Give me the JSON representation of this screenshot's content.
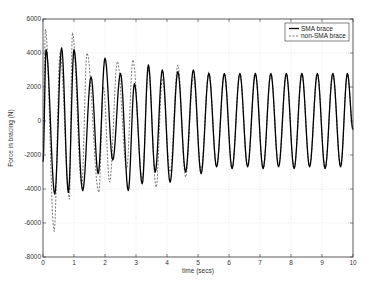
{
  "chart_data": {
    "type": "line",
    "title": "",
    "xlabel": "time (secs)",
    "ylabel": "Force in bracing (N)",
    "xlim": [
      0,
      10
    ],
    "ylim": [
      -8000,
      6000
    ],
    "xticks": [
      0,
      1,
      2,
      3,
      4,
      5,
      6,
      7,
      8,
      9,
      10
    ],
    "yticks": [
      -8000,
      -6000,
      -4000,
      -2000,
      0,
      2000,
      4000,
      6000
    ],
    "grid": true,
    "legend_position": "upper right",
    "series": [
      {
        "name": "SMA brace",
        "style": "solid",
        "color": "#000000",
        "extrema": [
          [
            0.0,
            -2400
          ],
          [
            0.1,
            4200
          ],
          [
            0.38,
            -4300
          ],
          [
            0.6,
            4300
          ],
          [
            0.82,
            -4200
          ],
          [
            1.0,
            4200
          ],
          [
            1.28,
            -4100
          ],
          [
            1.55,
            2600
          ],
          [
            1.78,
            -3100
          ],
          [
            2.0,
            3700
          ],
          [
            2.25,
            -2300
          ],
          [
            2.5,
            2800
          ],
          [
            2.75,
            -4100
          ],
          [
            2.95,
            2200
          ],
          [
            3.2,
            -3700
          ],
          [
            3.4,
            3300
          ],
          [
            3.62,
            -3000
          ],
          [
            3.85,
            3000
          ],
          [
            4.1,
            -3600
          ],
          [
            4.35,
            2900
          ],
          [
            4.6,
            -3000
          ],
          [
            4.85,
            3000
          ],
          [
            5.1,
            -3100
          ],
          [
            5.35,
            2800
          ],
          [
            5.6,
            -2700
          ],
          [
            5.85,
            2800
          ],
          [
            6.1,
            -2800
          ],
          [
            6.35,
            2800
          ],
          [
            6.6,
            -2700
          ],
          [
            6.85,
            2800
          ],
          [
            7.1,
            -2800
          ],
          [
            7.35,
            2800
          ],
          [
            7.6,
            -2700
          ],
          [
            7.85,
            2800
          ],
          [
            8.1,
            -2800
          ],
          [
            8.35,
            2800
          ],
          [
            8.6,
            -2700
          ],
          [
            8.85,
            2800
          ],
          [
            9.1,
            -2800
          ],
          [
            9.35,
            2800
          ],
          [
            9.6,
            -2700
          ],
          [
            9.82,
            2800
          ],
          [
            10.0,
            -500
          ]
        ]
      },
      {
        "name": "non-SMA brace",
        "style": "dashed",
        "color": "#555555",
        "extrema": [
          [
            0.0,
            -1500
          ],
          [
            0.08,
            5400
          ],
          [
            0.36,
            -6500
          ],
          [
            0.55,
            4000
          ],
          [
            0.85,
            -4600
          ],
          [
            0.95,
            5200
          ],
          [
            1.25,
            -3800
          ],
          [
            1.42,
            4000
          ],
          [
            1.8,
            -4200
          ],
          [
            1.95,
            2000
          ],
          [
            2.15,
            -3600
          ],
          [
            2.4,
            3500
          ],
          [
            2.7,
            -2800
          ],
          [
            2.9,
            3600
          ],
          [
            3.2,
            -3400
          ],
          [
            3.4,
            3000
          ],
          [
            3.65,
            -3900
          ],
          [
            3.85,
            2500
          ],
          [
            4.1,
            -3000
          ],
          [
            4.35,
            3300
          ],
          [
            4.6,
            -3300
          ],
          [
            4.85,
            2600
          ],
          [
            5.1,
            -2900
          ],
          [
            5.35,
            2900
          ],
          [
            5.6,
            -2700
          ],
          [
            5.85,
            2800
          ],
          [
            6.1,
            -2800
          ],
          [
            6.35,
            2800
          ],
          [
            6.6,
            -2700
          ],
          [
            6.85,
            2800
          ],
          [
            7.1,
            -2800
          ],
          [
            7.35,
            2800
          ],
          [
            7.6,
            -2700
          ],
          [
            7.85,
            2800
          ],
          [
            8.1,
            -2800
          ],
          [
            8.35,
            2800
          ],
          [
            8.6,
            -2700
          ],
          [
            8.85,
            2800
          ],
          [
            9.1,
            -2800
          ],
          [
            9.35,
            2800
          ],
          [
            9.6,
            -2700
          ],
          [
            9.82,
            2800
          ],
          [
            10.0,
            -500
          ]
        ]
      }
    ]
  },
  "legend": {
    "items": [
      {
        "label": "SMA brace"
      },
      {
        "label": "non-SMA brace"
      }
    ]
  },
  "axes": {
    "xlabel": "time (secs)",
    "ylabel": "Force in bracing (N)"
  },
  "colors": {
    "axis": "#333333",
    "grid": "#d0d0d0",
    "sma_line": "#000000",
    "non_sma_line": "#555555"
  }
}
